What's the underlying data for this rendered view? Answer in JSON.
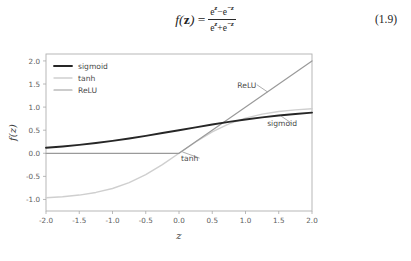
{
  "equation": {
    "lhs": "f(z)",
    "lhs_func": "f",
    "lhs_open": "(",
    "lhs_var": "z",
    "lhs_close": ")",
    "equals": "=",
    "numerator": "e^z − e^−z",
    "denominator": "e^z + e^−z",
    "num_base1": "e",
    "num_exp1": "z",
    "num_op": "−",
    "num_base2": "e",
    "num_exp2": "−z",
    "den_base1": "e",
    "den_exp1": "z",
    "den_op": "+",
    "den_base2": "e",
    "den_exp2": "−z",
    "number": "(1.9)"
  },
  "chart_data": {
    "type": "line",
    "title": "",
    "xlabel": "z",
    "ylabel": "f(z)",
    "xlim": [
      -2.0,
      2.0
    ],
    "ylim": [
      -1.25,
      2.15
    ],
    "xticks": [
      "-2.0",
      "-1.5",
      "-1.0",
      "-0.5",
      "0.0",
      "0.5",
      "1.0",
      "1.5",
      "2.0"
    ],
    "xtick_values": [
      -2.0,
      -1.5,
      -1.0,
      -0.5,
      0.0,
      0.5,
      1.0,
      1.5,
      2.0
    ],
    "yticks": [
      "2.0",
      "1.5",
      "1.0",
      "0.5",
      "0.0",
      "-0.5",
      "-1.0"
    ],
    "ytick_values": [
      2.0,
      1.5,
      1.0,
      0.5,
      0.0,
      -0.5,
      -1.0
    ],
    "grid": false,
    "legend_position": "upper left",
    "series": [
      {
        "name": "sigmoid",
        "color": "#262626",
        "width": 1.9,
        "x": [
          -2.0,
          -1.75,
          -1.5,
          -1.25,
          -1.0,
          -0.75,
          -0.5,
          -0.25,
          0.0,
          0.25,
          0.5,
          0.75,
          1.0,
          1.25,
          1.5,
          1.75,
          2.0
        ],
        "values": [
          0.119,
          0.148,
          0.182,
          0.223,
          0.269,
          0.321,
          0.378,
          0.438,
          0.5,
          0.562,
          0.622,
          0.679,
          0.731,
          0.777,
          0.818,
          0.852,
          0.881
        ]
      },
      {
        "name": "tanh",
        "color": "#cfcfcf",
        "width": 1.4,
        "x": [
          -2.0,
          -1.75,
          -1.5,
          -1.25,
          -1.0,
          -0.75,
          -0.5,
          -0.25,
          0.0,
          0.25,
          0.5,
          0.75,
          1.0,
          1.25,
          1.5,
          1.75,
          2.0
        ],
        "values": [
          -0.964,
          -0.941,
          -0.905,
          -0.848,
          -0.762,
          -0.635,
          -0.462,
          -0.245,
          0.0,
          0.245,
          0.462,
          0.635,
          0.762,
          0.848,
          0.905,
          0.941,
          0.964
        ]
      },
      {
        "name": "ReLU",
        "color": "#9a9a9a",
        "width": 1.2,
        "x": [
          -2.0,
          0.0,
          2.0
        ],
        "values": [
          0.0,
          0.0,
          2.0
        ]
      }
    ],
    "annotations": [
      {
        "text": "ReLU",
        "label_x": 1.02,
        "label_y": 1.42,
        "tip_x": 1.33,
        "tip_y": 1.33
      },
      {
        "text": "sigmoid",
        "label_x": 1.55,
        "label_y": 0.58,
        "tip_x": 1.53,
        "tip_y": 0.81
      },
      {
        "text": "tanh",
        "label_x": 0.16,
        "label_y": -0.17,
        "tip_x": 0.05,
        "tip_y": 0.03
      }
    ],
    "legend": [
      {
        "label": "sigmoid",
        "color": "#262626",
        "width": 1.9
      },
      {
        "label": "tanh",
        "color": "#cfcfcf",
        "width": 1.4
      },
      {
        "label": "ReLU",
        "color": "#9a9a9a",
        "width": 1.2
      }
    ]
  },
  "page_footer": {
    "sliver_text": "                                                                                                                    "
  }
}
